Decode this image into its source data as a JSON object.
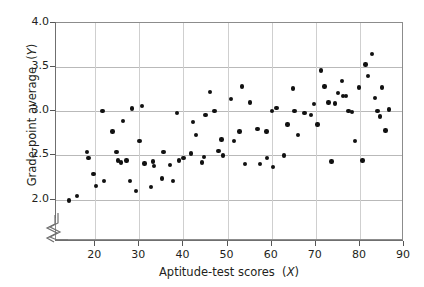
{
  "chart_data": {
    "type": "scatter",
    "title": "",
    "xlabel": "Aptitude-test scores (X)",
    "ylabel": "Grade-point average (Y)",
    "xlabel_text": "Aptitude-test scores",
    "xlabel_var": "X",
    "ylabel_text": "Grade-point average",
    "ylabel_var": "Y",
    "xlim": [
      11.1,
      90
    ],
    "ylim": [
      1.53,
      4.0
    ],
    "xticks": [
      20,
      30,
      40,
      50,
      60,
      70,
      80,
      90
    ],
    "yticks": [
      2.0,
      2.5,
      3.0,
      3.5,
      4.0
    ],
    "xtick_labels": [
      "20",
      "30",
      "40",
      "50",
      "60",
      "70",
      "80",
      "90"
    ],
    "ytick_labels": [
      "2.0",
      "2.5",
      "3.0",
      "3.5",
      "4.0"
    ],
    "grid": true,
    "grid_axes": "both",
    "axis_break": true,
    "axis_break_note": "x-axis broken between 0 and ~14",
    "marker": "filled-circle",
    "marker_color": "#111111",
    "marker_size_px": 4.4,
    "n_points": 86,
    "points": [
      [
        14.0,
        1.99
      ],
      [
        15.9,
        2.04
      ],
      [
        18.1,
        2.54
      ],
      [
        18.5,
        2.47
      ],
      [
        19.6,
        2.29
      ],
      [
        20.2,
        2.15
      ],
      [
        22.0,
        2.21
      ],
      [
        24.8,
        2.54
      ],
      [
        25.2,
        2.44
      ],
      [
        21.6,
        3.0
      ],
      [
        23.9,
        2.77
      ],
      [
        26.3,
        2.89
      ],
      [
        27.1,
        2.44
      ],
      [
        27.9,
        2.21
      ],
      [
        29.2,
        2.1
      ],
      [
        25.8,
        2.42
      ],
      [
        28.3,
        3.03
      ],
      [
        30.0,
        2.66
      ],
      [
        31.2,
        2.41
      ],
      [
        32.6,
        2.14
      ],
      [
        30.6,
        3.06
      ],
      [
        33.3,
        2.38
      ],
      [
        33.1,
        2.43
      ],
      [
        35.2,
        2.24
      ],
      [
        35.5,
        2.54
      ],
      [
        36.9,
        2.39
      ],
      [
        37.6,
        2.21
      ],
      [
        39.0,
        2.44
      ],
      [
        40.0,
        2.47
      ],
      [
        41.7,
        2.52
      ],
      [
        38.6,
        2.98
      ],
      [
        42.2,
        2.88
      ],
      [
        42.9,
        2.73
      ],
      [
        44.2,
        2.42
      ],
      [
        45.0,
        2.96
      ],
      [
        46.0,
        3.22
      ],
      [
        47.0,
        3.0
      ],
      [
        47.9,
        2.55
      ],
      [
        44.6,
        2.48
      ],
      [
        48.6,
        2.68
      ],
      [
        49.0,
        2.5
      ],
      [
        52.7,
        2.77
      ],
      [
        50.8,
        3.14
      ],
      [
        51.5,
        2.66
      ],
      [
        53.3,
        3.28
      ],
      [
        55.1,
        3.1
      ],
      [
        54.0,
        2.4
      ],
      [
        56.8,
        2.8
      ],
      [
        58.8,
        2.77
      ],
      [
        59.0,
        2.47
      ],
      [
        57.3,
        2.4
      ],
      [
        61.1,
        3.04
      ],
      [
        60.1,
        3.0
      ],
      [
        62.8,
        2.5
      ],
      [
        60.3,
        2.37
      ],
      [
        63.6,
        2.85
      ],
      [
        64.8,
        3.26
      ],
      [
        65.2,
        3.0
      ],
      [
        66.0,
        2.73
      ],
      [
        67.4,
        2.98
      ],
      [
        68.9,
        2.96
      ],
      [
        69.6,
        3.08
      ],
      [
        70.4,
        2.85
      ],
      [
        71.2,
        3.46
      ],
      [
        72.0,
        3.28
      ],
      [
        72.9,
        3.1
      ],
      [
        73.6,
        2.43
      ],
      [
        74.3,
        3.09
      ],
      [
        75.1,
        3.21
      ],
      [
        75.9,
        3.34
      ],
      [
        76.2,
        3.17
      ],
      [
        76.8,
        3.17
      ],
      [
        77.4,
        3.0
      ],
      [
        78.2,
        2.99
      ],
      [
        78.9,
        2.66
      ],
      [
        79.8,
        3.27
      ],
      [
        80.6,
        2.44
      ],
      [
        81.3,
        3.53
      ],
      [
        81.9,
        3.4
      ],
      [
        82.7,
        3.65
      ],
      [
        83.4,
        3.15
      ],
      [
        84.0,
        3.0
      ],
      [
        84.5,
        2.94
      ],
      [
        85.0,
        3.27
      ],
      [
        85.8,
        2.78
      ],
      [
        86.6,
        3.02
      ]
    ]
  }
}
